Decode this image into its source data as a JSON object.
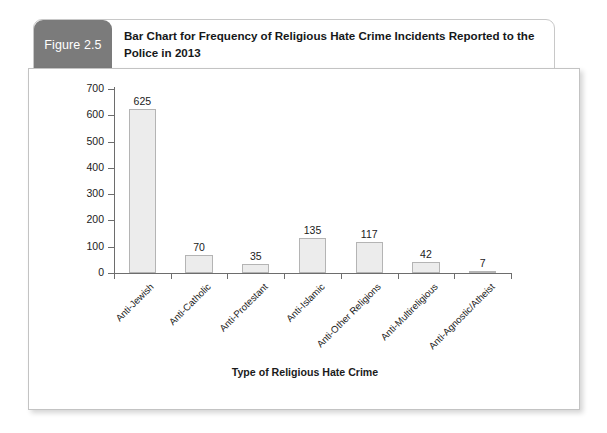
{
  "figure": {
    "tab_label": "Figure 2.5",
    "title": "Bar Chart for Frequency of Religious Hate Crime Incidents Reported to the Police in 2013",
    "tab_color": "#7b7b7b",
    "panel_border_color": "#c3c3c3"
  },
  "chart_data": {
    "type": "bar",
    "title": "Bar Chart for Frequency of Religious Hate Crime Incidents Reported to the Police in 2013",
    "xlabel": "Type of Religious Hate Crime",
    "ylabel": "",
    "categories": [
      "Anti-Jewish",
      "Anti-Catholic",
      "Anti-Protestant",
      "Anti-Islamic",
      "Anti-Other Religions",
      "Anti-Multireligious",
      "Anti-Agnostic/Atheist"
    ],
    "values": [
      625,
      70,
      35,
      135,
      117,
      42,
      7
    ],
    "ylim": [
      0,
      700
    ],
    "yticks": [
      0,
      100,
      200,
      300,
      400,
      500,
      600,
      700
    ],
    "ytick_labels": [
      "0",
      "100",
      "200",
      "300",
      "400",
      "500",
      "600",
      "700"
    ],
    "value_labels": [
      "625",
      "70",
      "35",
      "135",
      "117",
      "42",
      "7"
    ],
    "grid": false,
    "legend": false,
    "bar_fill": "#ececec",
    "bar_border": "#b4b4b4",
    "axis_color": "#6d6d6d",
    "label_rotation": -45
  }
}
